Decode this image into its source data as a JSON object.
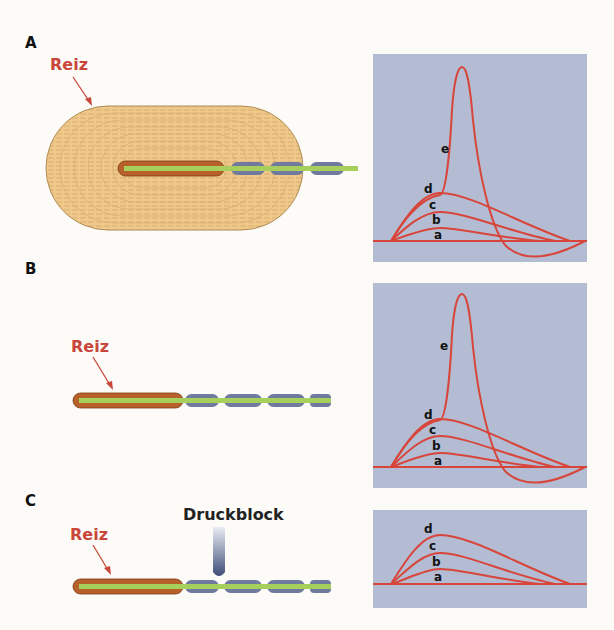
{
  "figure": {
    "panels": [
      {
        "letter": "A",
        "stimulus_label": "Reiz",
        "structure": "Pacini-Körperchen mit Kapsel",
        "curve_labels": [
          "a",
          "b",
          "c",
          "d",
          "e"
        ]
      },
      {
        "letter": "B",
        "stimulus_label": "Reiz",
        "structure": "Nervenendigung ohne Kapsel",
        "curve_labels": [
          "a",
          "b",
          "c",
          "d",
          "e"
        ]
      },
      {
        "letter": "C",
        "stimulus_label": "Reiz",
        "block_label": "Druckblock",
        "structure": "Nervenendigung mit Druckblock",
        "curve_labels": [
          "a",
          "b",
          "c",
          "d"
        ]
      }
    ]
  },
  "colors": {
    "plot_background": "#b3bcd2",
    "curve": "#d8453a",
    "stimulus_text": "#c8473a",
    "capsule": "#f0c98a",
    "unmyelinated_terminal": "#b8602a",
    "axon": "#a6cf5c",
    "myelin": "#6f7a9e"
  }
}
